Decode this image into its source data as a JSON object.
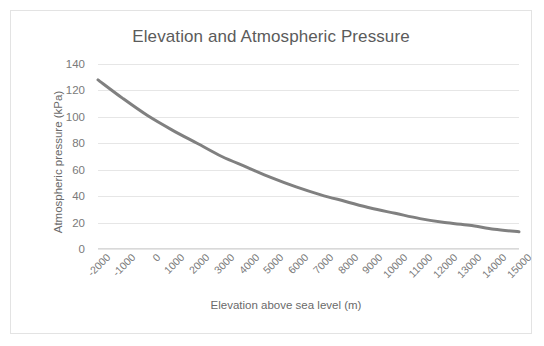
{
  "chart_data": {
    "type": "line",
    "title": "Elevation and Atmospheric Pressure",
    "xlabel": "Elevation above sea level (m)",
    "ylabel": "Atmospheric pressure (kPa)",
    "xlim": [
      -2000,
      15000
    ],
    "ylim": [
      0,
      140
    ],
    "grid": true,
    "legend": "none",
    "line_color": "#808080",
    "x_tick_labels": [
      "-2000",
      "-1000",
      "0",
      "1000",
      "2000",
      "3000",
      "4000",
      "5000",
      "6000",
      "7000",
      "8000",
      "9000",
      "10000",
      "11000",
      "12000",
      "13000",
      "14000",
      "15000"
    ],
    "y_tick_labels": [
      "0",
      "20",
      "40",
      "60",
      "80",
      "100",
      "120",
      "140"
    ],
    "y_ticks": [
      0,
      20,
      40,
      60,
      80,
      100,
      120,
      140
    ],
    "x": [
      -2000,
      -1000,
      0,
      1000,
      2000,
      3000,
      4000,
      5000,
      6000,
      7000,
      8000,
      9000,
      10000,
      11000,
      12000,
      13000,
      14000,
      15000
    ],
    "values": [
      128,
      114,
      101,
      90,
      80,
      70,
      62,
      54,
      47,
      41,
      36,
      31,
      27,
      23,
      20,
      18,
      15,
      13
    ],
    "series": [
      {
        "name": "Atmospheric pressure",
        "values": [
          128,
          114,
          101,
          90,
          80,
          70,
          62,
          54,
          47,
          41,
          36,
          31,
          27,
          23,
          20,
          18,
          15,
          13
        ]
      }
    ]
  },
  "style": {
    "title_color": "#5b5b5b",
    "tick_color": "#7a7a7a",
    "grid_color": "#e6e6e6",
    "border_color": "#e3e3e3",
    "background": "#ffffff"
  }
}
